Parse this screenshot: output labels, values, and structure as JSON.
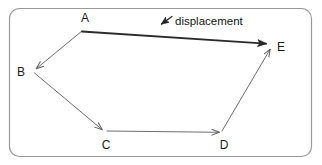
{
  "figure": {
    "type": "vector-path-diagram",
    "background_color": "#ffffff",
    "frame": {
      "stroke_color": "#9a9a9a",
      "fill_color": "#ffffff",
      "corner_radius": 10,
      "x": 9,
      "y": 8,
      "width": 303,
      "height": 149
    },
    "path_stroke_color": "#6e6e6e",
    "resultant_stroke_color": "#2b2b2b",
    "pointer_stroke_color": "#2b2b2b"
  },
  "points": [
    {
      "id": "A",
      "label": "A",
      "x": 82,
      "y": 31,
      "label_x": 85,
      "label_y": 22
    },
    {
      "id": "B",
      "label": "B",
      "x": 34,
      "y": 71,
      "label_x": 21,
      "label_y": 76
    },
    {
      "id": "C",
      "label": "C",
      "x": 105,
      "y": 132,
      "label_x": 106,
      "label_y": 149
    },
    {
      "id": "D",
      "label": "D",
      "x": 222,
      "y": 132,
      "label_x": 224,
      "label_y": 149
    },
    {
      "id": "E",
      "label": "E",
      "x": 272,
      "y": 45,
      "label_x": 281,
      "label_y": 51
    }
  ],
  "segments": [
    {
      "id": "A-B",
      "from": "A",
      "to": "B",
      "kind": "leg",
      "arrow_at": "B"
    },
    {
      "id": "B-C",
      "from": "B",
      "to": "C",
      "kind": "leg",
      "arrow_at": "C"
    },
    {
      "id": "C-D",
      "from": "C",
      "to": "D",
      "kind": "leg",
      "arrow_at": "D"
    },
    {
      "id": "D-E",
      "from": "D",
      "to": "E",
      "kind": "leg",
      "arrow_at": "E"
    },
    {
      "id": "A-E",
      "from": "A",
      "to": "E",
      "kind": "resultant",
      "arrow_at": "E"
    }
  ],
  "annotation": {
    "label": "displacement",
    "label_x": 175,
    "label_y": 25,
    "pointer_from_x": 172,
    "pointer_from_y": 17,
    "pointer_to_x": 159,
    "pointer_to_y": 26
  }
}
